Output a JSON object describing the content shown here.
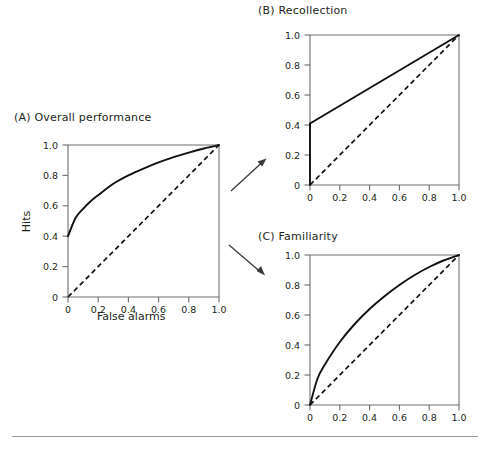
{
  "figure": {
    "background": "#ffffff",
    "line_color": "#111111",
    "axis_color": "#6e6e6e",
    "arrow_color": "#3a3a3a",
    "rule_color": "#9a9a9a"
  },
  "panels": {
    "a": {
      "title": "(A)  Overall performance",
      "label": "(A)",
      "name": "Overall performance",
      "xlabel": "False alarms",
      "ylabel": "Hits"
    },
    "b": {
      "title": "(B)  Recollection",
      "label": "(B)",
      "name": "Recollection",
      "xlabel": "",
      "ylabel": ""
    },
    "c": {
      "title": "(C)  Familiarity",
      "label": "(C)",
      "name": "Familiarity",
      "xlabel": "",
      "ylabel": ""
    }
  },
  "ticks": {
    "x": [
      "0",
      "0.2",
      "0.4",
      "0.6",
      "0.8",
      "1.0"
    ],
    "y": [
      "0",
      "0.2",
      "0.4",
      "0.6",
      "0.8",
      "1.0"
    ],
    "values": [
      0,
      0.2,
      0.4,
      0.6,
      0.8,
      1.0
    ]
  },
  "arrows": {
    "to_recollection": "arrow-up-right",
    "to_familiarity": "arrow-down-right"
  },
  "chart_data": [
    {
      "id": "a",
      "type": "line",
      "title": "(A)  Overall performance",
      "xlabel": "False alarms",
      "ylabel": "Hits",
      "xlim": [
        0,
        1
      ],
      "ylim": [
        0,
        1
      ],
      "xticks": [
        0,
        0.2,
        0.4,
        0.6,
        0.8,
        1.0
      ],
      "yticks": [
        0,
        0.2,
        0.4,
        0.6,
        0.8,
        1.0
      ],
      "grid": false,
      "legend": "none",
      "series": [
        {
          "name": "Overall ROC",
          "style": "solid",
          "x": [
            0,
            0.05,
            0.1,
            0.15,
            0.2,
            0.3,
            0.4,
            0.5,
            0.6,
            0.7,
            0.8,
            0.9,
            1.0
          ],
          "y": [
            0.4,
            0.52,
            0.58,
            0.63,
            0.67,
            0.745,
            0.8,
            0.845,
            0.885,
            0.92,
            0.95,
            0.977,
            1.0
          ]
        },
        {
          "name": "Chance diagonal",
          "style": "dashed",
          "x": [
            0,
            1.0
          ],
          "y": [
            0,
            1.0
          ]
        }
      ]
    },
    {
      "id": "b",
      "type": "line",
      "title": "(B)  Recollection",
      "xlabel": "",
      "ylabel": "",
      "xlim": [
        0,
        1
      ],
      "ylim": [
        0,
        1
      ],
      "xticks": [
        0,
        0.2,
        0.4,
        0.6,
        0.8,
        1.0
      ],
      "yticks": [
        0,
        0.2,
        0.4,
        0.6,
        0.8,
        1.0
      ],
      "grid": false,
      "legend": "none",
      "series": [
        {
          "name": "Recollection threshold segment",
          "style": "solid",
          "x": [
            0,
            0
          ],
          "y": [
            0,
            0.41
          ]
        },
        {
          "name": "Recollection ROC",
          "style": "solid",
          "x": [
            0,
            1.0
          ],
          "y": [
            0.41,
            1.0
          ]
        },
        {
          "name": "Chance diagonal",
          "style": "dashed",
          "x": [
            0,
            1.0
          ],
          "y": [
            0,
            1.0
          ]
        }
      ]
    },
    {
      "id": "c",
      "type": "line",
      "title": "(C)  Familiarity",
      "xlabel": "",
      "ylabel": "",
      "xlim": [
        0,
        1
      ],
      "ylim": [
        0,
        1
      ],
      "xticks": [
        0,
        0.2,
        0.4,
        0.6,
        0.8,
        1.0
      ],
      "yticks": [
        0,
        0.2,
        0.4,
        0.6,
        0.8,
        1.0
      ],
      "grid": false,
      "legend": "none",
      "series": [
        {
          "name": "Familiarity ROC",
          "style": "solid",
          "x": [
            0,
            0.05,
            0.1,
            0.2,
            0.3,
            0.4,
            0.5,
            0.6,
            0.7,
            0.8,
            0.9,
            1.0
          ],
          "y": [
            0,
            0.175,
            0.27,
            0.42,
            0.54,
            0.64,
            0.725,
            0.8,
            0.865,
            0.92,
            0.965,
            1.0
          ]
        },
        {
          "name": "Chance diagonal",
          "style": "dashed",
          "x": [
            0,
            1.0
          ],
          "y": [
            0,
            1.0
          ]
        }
      ]
    }
  ]
}
